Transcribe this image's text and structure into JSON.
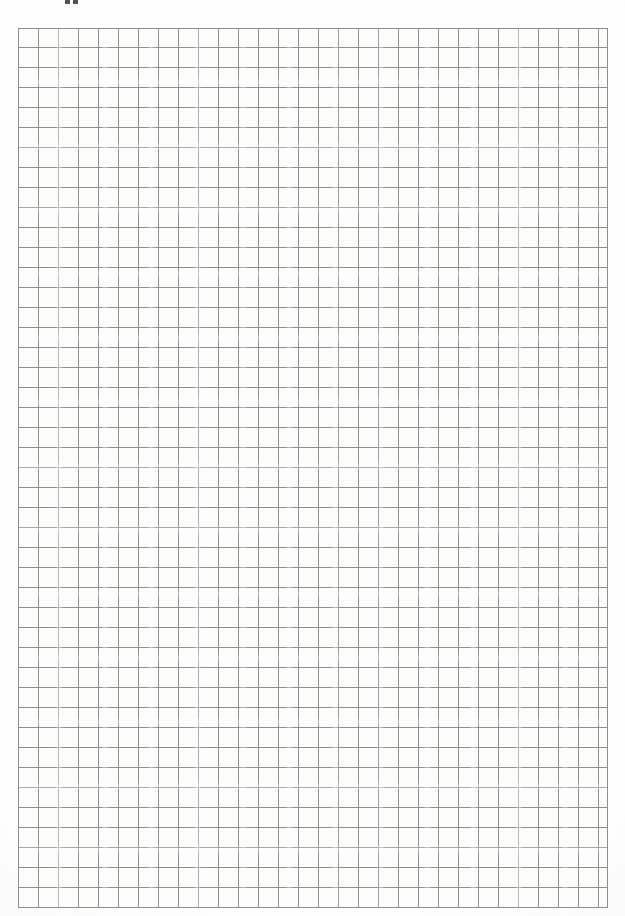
{
  "document": {
    "kind": "scanned-grid-paper",
    "title": "Blank graph paper sheet",
    "page_width": 625,
    "page_height": 916,
    "background_color": "#ffffff",
    "paper_color": "#fdfdfc",
    "has_visible_text": false,
    "notes": "Blank squared / quadrille graph paper, scanned. No headings, labels, numbers or handwriting are present anywhere on the sheet."
  },
  "grid": {
    "label": "graph-paper-grid",
    "columns": 30,
    "rows": 44,
    "cell_width_px": 20,
    "cell_height_px": 20,
    "left_px": 18,
    "top_px": 28,
    "width_px": 590,
    "height_px": 880,
    "line_color": "#8e8e8e",
    "line_color_light": "#b4b4b4",
    "line_width_px": 1,
    "border_color": "#8e8e8e",
    "major_grid": false
  },
  "artifacts": {
    "label": "scan-artifacts",
    "edge_marks": [
      {
        "name": "ink-mark-left",
        "left_px": 65,
        "width_px": 5,
        "height_px": 4
      },
      {
        "name": "ink-mark-right",
        "left_px": 73,
        "width_px": 5,
        "height_px": 4
      }
    ],
    "edge_mark_color": "#2c2c2c",
    "description": "Two small clipped ink marks at the extreme top edge, the cut-off lower tips of content trimmed off during scanning."
  },
  "chart_data": {
    "type": "table",
    "xlabel": "",
    "ylabel": "",
    "columns": 30,
    "rows": 44,
    "cell_size": 20,
    "values": [],
    "categories": [],
    "legend": [],
    "grid": true,
    "annotations": []
  }
}
